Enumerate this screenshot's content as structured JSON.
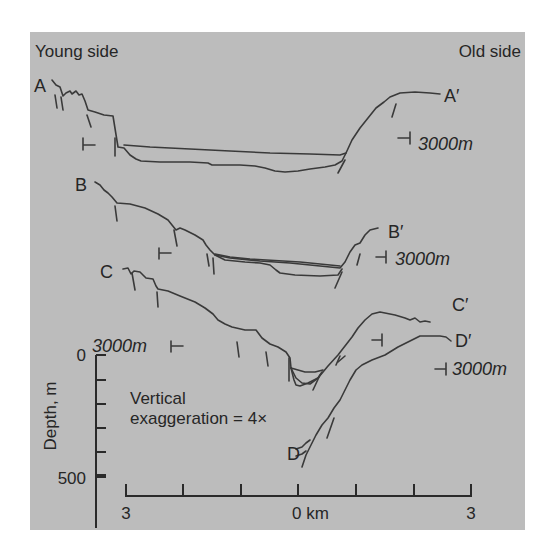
{
  "figure": {
    "background_color": "#bcbcbc",
    "line_color": "#3a3a3a",
    "headers": {
      "left": "Young side",
      "right": "Old side"
    },
    "profiles": [
      {
        "start_label": "A",
        "end_label": "A′",
        "scale_label": "3000m"
      },
      {
        "start_label": "B",
        "end_label": "B′",
        "scale_label": "3000m"
      },
      {
        "start_label": "C",
        "end_label": "C′",
        "scale_label": "3000m"
      },
      {
        "start_label": "D",
        "end_label": "D′",
        "scale_label": "3000m"
      }
    ],
    "depth_axis": {
      "label": "Depth, m",
      "top_tick": "0",
      "bottom_tick": "500"
    },
    "note_line1": "Vertical",
    "note_line2": "exaggeration = 4×",
    "distance_axis": {
      "left": "3",
      "center": "0 km",
      "right": "3"
    }
  }
}
